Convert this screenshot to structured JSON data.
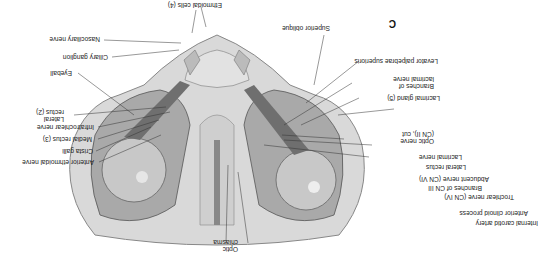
{
  "figure": {
    "panel_label": "C",
    "orientation": "rotated 180 degrees",
    "colors": {
      "background": "#ffffff",
      "bone": "#d9d9d9",
      "tissue": "#9a9a9a",
      "text": "#222222"
    }
  },
  "labels": {
    "nasociliary_nerve": "Nasociliary nerve",
    "ciliary_ganglion": "Ciliary ganglion",
    "lateral_rectus_2_line1": "Lateral",
    "lateral_rectus_2_line2": "rectus (2)",
    "eyeball": "Eyeball",
    "medial_rectus_3": "Medial rectus (3)",
    "infratrochlear_nerve": "Infratrochlear nerve",
    "anterior_ethmoidal_nerve": "Anterior ethmoidal nerve",
    "crista_galli": "Crista galli",
    "ethmoidal_cells_4": "Ethmoidal cells (4)",
    "superior_oblique": "Superior oblique",
    "levator_palpebrae_superioris": "Levator palpebrae superioris",
    "lacrimal_gland_5": "Lacrimal gland (5)",
    "branches_lacrimal_line1": "Branches of",
    "branches_lacrimal_line2": "lacrimal nerve",
    "optic_nerve_cut_line1": "Optic nerve",
    "optic_nerve_cut_line2": "(CN II), cut",
    "lacrimal_nerve": "Lacrimal nerve",
    "lateral_rectus": "Lateral rectus",
    "abducent_nerve": "Abducent nerve (CN VI)",
    "branches_cn3": "Branches of CN III",
    "trochlear_nerve": "Trochlear nerve (CN IV)",
    "anterior_clinoid_process": "Anterior clinoid process",
    "internal_carotid_artery": "Internal carotid artery",
    "optic_chiasma_line1": "Optic",
    "optic_chiasma_line2": "chiasma"
  }
}
